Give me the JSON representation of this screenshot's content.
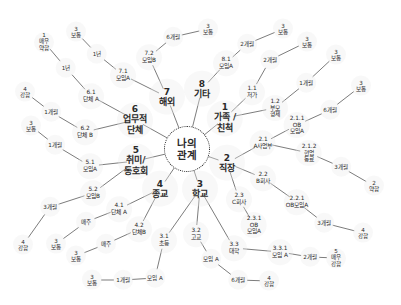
{
  "diagram": {
    "title": "나의 관계",
    "center": {
      "id": "center",
      "lines": [
        "나의",
        "관계"
      ],
      "x": 187,
      "y": 149,
      "r": 22
    },
    "nodes": [
      {
        "id": "n1",
        "type": "main",
        "lines": [
          "1",
          "가족 /",
          "친척"
        ],
        "x": 225,
        "y": 118
      },
      {
        "id": "n2",
        "type": "main",
        "lines": [
          "2",
          "직장"
        ],
        "x": 227,
        "y": 163
      },
      {
        "id": "n3",
        "type": "main",
        "lines": [
          "3",
          "학교"
        ],
        "x": 200,
        "y": 189
      },
      {
        "id": "n4",
        "type": "main",
        "lines": [
          "4",
          "종교"
        ],
        "x": 160,
        "y": 189
      },
      {
        "id": "n5",
        "type": "main",
        "lines": [
          "5",
          "취미/",
          "동호회"
        ],
        "x": 136,
        "y": 161
      },
      {
        "id": "n6",
        "type": "main",
        "lines": [
          "6",
          "업무적",
          "단체"
        ],
        "x": 135,
        "y": 120
      },
      {
        "id": "n7",
        "type": "main",
        "lines": [
          "7",
          "해외"
        ],
        "x": 167,
        "y": 97
      },
      {
        "id": "n8",
        "type": "main",
        "lines": [
          "8",
          "기타"
        ],
        "x": 202,
        "y": 89
      },
      {
        "id": "n1_1",
        "type": "sub",
        "lines": [
          "1.1",
          "저가"
        ],
        "x": 252,
        "y": 92
      },
      {
        "id": "n1_1_t",
        "type": "leaf",
        "lines": [
          "2개월"
        ],
        "x": 270,
        "y": 60
      },
      {
        "id": "n1_1_s",
        "type": "leaf",
        "lines": [
          "3",
          "보통"
        ],
        "x": 307,
        "y": 42
      },
      {
        "id": "n1_2",
        "type": "sub",
        "lines": [
          "1.2",
          "부모",
          "형제"
        ],
        "x": 275,
        "y": 108
      },
      {
        "id": "n1_2_t",
        "type": "leaf",
        "lines": [
          "1개월"
        ],
        "x": 306,
        "y": 83
      },
      {
        "id": "n1_2_s",
        "type": "leaf",
        "lines": [
          "3",
          "보통"
        ],
        "x": 336,
        "y": 55
      },
      {
        "id": "n8_1",
        "type": "sub",
        "lines": [
          "8.1",
          "모임A"
        ],
        "x": 226,
        "y": 63
      },
      {
        "id": "n8_1_t",
        "type": "leaf",
        "lines": [
          "2개월"
        ],
        "x": 247,
        "y": 44
      },
      {
        "id": "n8_1_s",
        "type": "leaf",
        "lines": [
          "3",
          "보통"
        ],
        "x": 283,
        "y": 29
      },
      {
        "id": "n2_1",
        "type": "sub",
        "lines": [
          "2.1",
          "A사업부"
        ],
        "x": 263,
        "y": 143
      },
      {
        "id": "n2_1_1",
        "type": "sub",
        "lines": [
          "2.1.1",
          "OB",
          "모임A"
        ],
        "x": 297,
        "y": 125
      },
      {
        "id": "n2_1_1_t",
        "type": "leaf",
        "lines": [
          "6개월"
        ],
        "x": 330,
        "y": 110
      },
      {
        "id": "n2_1_1_s",
        "type": "leaf",
        "lines": [
          "3",
          "보통"
        ],
        "x": 361,
        "y": 86
      },
      {
        "id": "n2_1_2",
        "type": "sub",
        "lines": [
          "2.1.2",
          "현업",
          "동료"
        ],
        "x": 309,
        "y": 153
      },
      {
        "id": "n2_1_2_t",
        "type": "leaf",
        "lines": [
          "3개월"
        ],
        "x": 341,
        "y": 167
      },
      {
        "id": "n2_1_2_s",
        "type": "leaf",
        "lines": [
          "2",
          "약함"
        ],
        "x": 374,
        "y": 186
      },
      {
        "id": "n2_2",
        "type": "sub",
        "lines": [
          "2.2",
          "B회사"
        ],
        "x": 263,
        "y": 178
      },
      {
        "id": "n2_2_1",
        "type": "sub",
        "lines": [
          "2.2.1",
          "OB모임A"
        ],
        "x": 297,
        "y": 202
      },
      {
        "id": "n2_2_1_t",
        "type": "leaf",
        "lines": [
          "3개월"
        ],
        "x": 324,
        "y": 223
      },
      {
        "id": "n2_2_1_s",
        "type": "leaf",
        "lines": [
          "4",
          "강함"
        ],
        "x": 363,
        "y": 233
      },
      {
        "id": "n2_3",
        "type": "sub",
        "lines": [
          "2.3",
          "C회사"
        ],
        "x": 239,
        "y": 199
      },
      {
        "id": "n2_3_1",
        "type": "sub",
        "lines": [
          "2.3.1",
          "OB",
          "모임A"
        ],
        "x": 254,
        "y": 225
      },
      {
        "id": "n3_1",
        "type": "sub",
        "lines": [
          "3.1",
          "초등"
        ],
        "x": 164,
        "y": 240
      },
      {
        "id": "n3_1_g",
        "type": "leaf",
        "lines": [
          "모임 A"
        ],
        "x": 155,
        "y": 278
      },
      {
        "id": "n3_1_t",
        "type": "leaf",
        "lines": [
          "1개월"
        ],
        "x": 123,
        "y": 280
      },
      {
        "id": "n3_1_s",
        "type": "leaf",
        "lines": [
          "3",
          "보통"
        ],
        "x": 92,
        "y": 280
      },
      {
        "id": "n3_2",
        "type": "sub",
        "lines": [
          "3.2",
          "고교"
        ],
        "x": 196,
        "y": 234
      },
      {
        "id": "n3_2_g",
        "type": "leaf",
        "lines": [
          "모임 A"
        ],
        "x": 211,
        "y": 259
      },
      {
        "id": "n3_2_t",
        "type": "leaf",
        "lines": [
          "6개월"
        ],
        "x": 238,
        "y": 280
      },
      {
        "id": "n3_2_s",
        "type": "leaf",
        "lines": [
          "4",
          "강함"
        ],
        "x": 269,
        "y": 281
      },
      {
        "id": "n3_3",
        "type": "sub",
        "lines": [
          "3.3",
          "대학"
        ],
        "x": 234,
        "y": 248
      },
      {
        "id": "n3_3_1",
        "type": "sub",
        "lines": [
          "3.3.1",
          "모임 A"
        ],
        "x": 280,
        "y": 252
      },
      {
        "id": "n3_3_1_t",
        "type": "leaf",
        "lines": [
          "2개월"
        ],
        "x": 310,
        "y": 257
      },
      {
        "id": "n3_3_1_s",
        "type": "leaf",
        "lines": [
          "5",
          "매우",
          "강함"
        ],
        "x": 336,
        "y": 258
      },
      {
        "id": "n4_1",
        "type": "sub",
        "lines": [
          "4.1",
          "단체 A"
        ],
        "x": 119,
        "y": 209
      },
      {
        "id": "n4_1_t",
        "type": "leaf",
        "lines": [
          "매주"
        ],
        "x": 86,
        "y": 222
      },
      {
        "id": "n4_1_s",
        "type": "leaf",
        "lines": [
          "3",
          "보통"
        ],
        "x": 56,
        "y": 244
      },
      {
        "id": "n4_2",
        "type": "sub",
        "lines": [
          "4.2",
          "단체B"
        ],
        "x": 139,
        "y": 229
      },
      {
        "id": "n4_2_t",
        "type": "leaf",
        "lines": [
          "매주"
        ],
        "x": 106,
        "y": 244
      },
      {
        "id": "n4_2_s",
        "type": "leaf",
        "lines": [
          "3",
          "보통"
        ],
        "x": 76,
        "y": 256
      },
      {
        "id": "n5_1",
        "type": "sub",
        "lines": [
          "5.1",
          "모임A"
        ],
        "x": 90,
        "y": 166
      },
      {
        "id": "n5_1_t",
        "type": "leaf",
        "lines": [
          "1개월"
        ],
        "x": 55,
        "y": 145
      },
      {
        "id": "n5_1_s",
        "type": "leaf",
        "lines": [
          "3",
          "보통"
        ],
        "x": 31,
        "y": 126
      },
      {
        "id": "n5_2",
        "type": "sub",
        "lines": [
          "5.2",
          "모임B"
        ],
        "x": 93,
        "y": 193
      },
      {
        "id": "n5_2_t",
        "type": "leaf",
        "lines": [
          "3개월"
        ],
        "x": 50,
        "y": 207
      },
      {
        "id": "n5_2_s",
        "type": "leaf",
        "lines": [
          "4",
          "강함"
        ],
        "x": 23,
        "y": 245
      },
      {
        "id": "n6_1",
        "type": "sub",
        "lines": [
          "6.1",
          "단체 A"
        ],
        "x": 91,
        "y": 96
      },
      {
        "id": "n6_1_t",
        "type": "leaf",
        "lines": [
          "1년"
        ],
        "x": 66,
        "y": 68
      },
      {
        "id": "n6_1_s",
        "type": "leaf",
        "lines": [
          "1",
          "매우",
          "약함"
        ],
        "x": 44,
        "y": 42
      },
      {
        "id": "n6_2",
        "type": "sub",
        "lines": [
          "6.2",
          "단체 B"
        ],
        "x": 85,
        "y": 132
      },
      {
        "id": "n6_2_t",
        "type": "leaf",
        "lines": [
          "1개월"
        ],
        "x": 51,
        "y": 112
      },
      {
        "id": "n6_2_s",
        "type": "leaf",
        "lines": [
          "4",
          "강함"
        ],
        "x": 25,
        "y": 92
      },
      {
        "id": "n7_1",
        "type": "sub",
        "lines": [
          "7.1",
          "모임A"
        ],
        "x": 123,
        "y": 75
      },
      {
        "id": "n7_1_t",
        "type": "leaf",
        "lines": [
          "1년"
        ],
        "x": 97,
        "y": 54
      },
      {
        "id": "n7_1_s",
        "type": "leaf",
        "lines": [
          "3",
          "보통"
        ],
        "x": 76,
        "y": 32
      },
      {
        "id": "n7_2",
        "type": "sub",
        "lines": [
          "7.2",
          "모임B"
        ],
        "x": 149,
        "y": 57
      },
      {
        "id": "n7_2_t",
        "type": "leaf",
        "lines": [
          "6개월"
        ],
        "x": 173,
        "y": 37
      },
      {
        "id": "n7_2_s",
        "type": "leaf",
        "lines": [
          "3",
          "보통"
        ],
        "x": 208,
        "y": 29
      }
    ],
    "edges": [
      [
        "center",
        "n1"
      ],
      [
        "center",
        "n2"
      ],
      [
        "center",
        "n3"
      ],
      [
        "center",
        "n4"
      ],
      [
        "center",
        "n5"
      ],
      [
        "center",
        "n6"
      ],
      [
        "center",
        "n7"
      ],
      [
        "center",
        "n8"
      ],
      [
        "n1",
        "n1_1"
      ],
      [
        "n1_1",
        "n1_1_t"
      ],
      [
        "n1_1_t",
        "n1_1_s"
      ],
      [
        "n1",
        "n1_2"
      ],
      [
        "n1_2",
        "n1_2_t"
      ],
      [
        "n1_2_t",
        "n1_2_s"
      ],
      [
        "n8",
        "n8_1"
      ],
      [
        "n8_1",
        "n8_1_t"
      ],
      [
        "n8_1_t",
        "n8_1_s"
      ],
      [
        "n2",
        "n2_1"
      ],
      [
        "n2_1",
        "n2_1_1"
      ],
      [
        "n2_1_1",
        "n2_1_1_t"
      ],
      [
        "n2_1_1_t",
        "n2_1_1_s"
      ],
      [
        "n2_1",
        "n2_1_2"
      ],
      [
        "n2_1_2",
        "n2_1_2_t"
      ],
      [
        "n2_1_2_t",
        "n2_1_2_s"
      ],
      [
        "n2",
        "n2_2"
      ],
      [
        "n2_2",
        "n2_2_1"
      ],
      [
        "n2_2_1",
        "n2_2_1_t"
      ],
      [
        "n2_2_1_t",
        "n2_2_1_s"
      ],
      [
        "n2",
        "n2_3"
      ],
      [
        "n2_3",
        "n2_3_1"
      ],
      [
        "n3",
        "n3_1"
      ],
      [
        "n3_1",
        "n3_1_g"
      ],
      [
        "n3_1_g",
        "n3_1_t"
      ],
      [
        "n3_1_t",
        "n3_1_s"
      ],
      [
        "n3",
        "n3_2"
      ],
      [
        "n3_2",
        "n3_2_g"
      ],
      [
        "n3_2_g",
        "n3_2_t"
      ],
      [
        "n3_2_t",
        "n3_2_s"
      ],
      [
        "n3",
        "n3_3"
      ],
      [
        "n3_3",
        "n3_3_1"
      ],
      [
        "n3_3_1",
        "n3_3_1_t"
      ],
      [
        "n3_3_1_t",
        "n3_3_1_s"
      ],
      [
        "n4",
        "n4_1"
      ],
      [
        "n4_1",
        "n4_1_t"
      ],
      [
        "n4_1_t",
        "n4_1_s"
      ],
      [
        "n4",
        "n4_2"
      ],
      [
        "n4_2",
        "n4_2_t"
      ],
      [
        "n4_2_t",
        "n4_2_s"
      ],
      [
        "n5",
        "n5_1"
      ],
      [
        "n5_1",
        "n5_1_t"
      ],
      [
        "n5_1_t",
        "n5_1_s"
      ],
      [
        "n5",
        "n5_2"
      ],
      [
        "n5_2",
        "n5_2_t"
      ],
      [
        "n5_2_t",
        "n5_2_s"
      ],
      [
        "n6",
        "n6_1"
      ],
      [
        "n6_1",
        "n6_1_t"
      ],
      [
        "n6_1_t",
        "n6_1_s"
      ],
      [
        "n6",
        "n6_2"
      ],
      [
        "n6_2",
        "n6_2_t"
      ],
      [
        "n6_2_t",
        "n6_2_s"
      ],
      [
        "n7",
        "n7_1"
      ],
      [
        "n7_1",
        "n7_1_t"
      ],
      [
        "n7_1_t",
        "n7_1_s"
      ],
      [
        "n7",
        "n7_2"
      ],
      [
        "n7_2",
        "n7_2_t"
      ],
      [
        "n7_2_t",
        "n7_2_s"
      ]
    ],
    "colors": {
      "line": "#444444",
      "text": "#2a2a2a",
      "node_bg": "#ebebeb",
      "background": "#ffffff"
    }
  }
}
